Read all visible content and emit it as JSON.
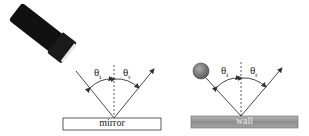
{
  "figure": {
    "panels": [
      {
        "name": "mirror-panel",
        "source": "flashlight",
        "surface_label": "mirror",
        "surface_style": "white",
        "incident_angle_symbol": "θ",
        "incident_angle_sub": "i",
        "reflected_angle_symbol": "θ",
        "reflected_angle_sub": "r"
      },
      {
        "name": "wall-panel",
        "source": "ball",
        "surface_label": "wall",
        "surface_style": "gray",
        "incident_angle_symbol": "θ",
        "incident_angle_sub": "i",
        "reflected_angle_symbol": "θ",
        "reflected_angle_sub": "r"
      }
    ],
    "colors": {
      "line": "#333333",
      "wall_fill": "#9a9a9a",
      "ball_fill": "#777777",
      "flashlight_body": "#111111"
    }
  }
}
